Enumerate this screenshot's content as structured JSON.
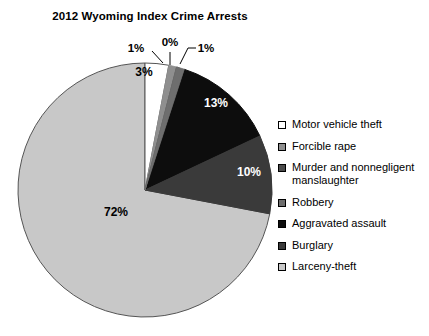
{
  "chart_data": {
    "type": "pie",
    "title": "2012 Wyoming Index Crime Arrests",
    "xlabel": "",
    "ylabel": "",
    "legend_position": "right",
    "grid": false,
    "categories": [
      "Motor vehicle theft",
      "Forcible rape",
      "Murder and nonnegligent manslaughter",
      "Robbery",
      "Aggravated assault",
      "Burglary",
      "Larceny-theft"
    ],
    "values": [
      3,
      1,
      0,
      1,
      13,
      10,
      72
    ],
    "value_labels": [
      "3%",
      "1%",
      "0%",
      "1%",
      "13%",
      "10%",
      "72%"
    ],
    "colors": [
      "#ffffff",
      "#8f8f8f",
      "#4a4a4a",
      "#6e6e6e",
      "#0d0d0d",
      "#3a3a3a",
      "#c8c8c8"
    ],
    "units": "percent",
    "start_angle_deg": 0,
    "direction": "clockwise"
  },
  "chart": {
    "title": "2012 Wyoming Index Crime Arrests",
    "slice_labels": {
      "motor_vehicle_theft": "3%",
      "forcible_rape": "1%",
      "murder": "0%",
      "robbery_small": "1%",
      "aggravated_assault": "13%",
      "robbery": "10%",
      "larceny_theft": "72%"
    }
  },
  "legend": {
    "items": [
      {
        "label": "Motor vehicle theft",
        "color": "#ffffff"
      },
      {
        "label": "Forcible rape",
        "color": "#8f8f8f"
      },
      {
        "label": "Murder and nonnegligent\nmanslaughter",
        "color": "#4a4a4a"
      },
      {
        "label": "Robbery",
        "color": "#6e6e6e"
      },
      {
        "label": "Aggravated assault",
        "color": "#0d0d0d"
      },
      {
        "label": "Burglary",
        "color": "#3a3a3a"
      },
      {
        "label": "Larceny-theft",
        "color": "#c8c8c8"
      }
    ]
  }
}
